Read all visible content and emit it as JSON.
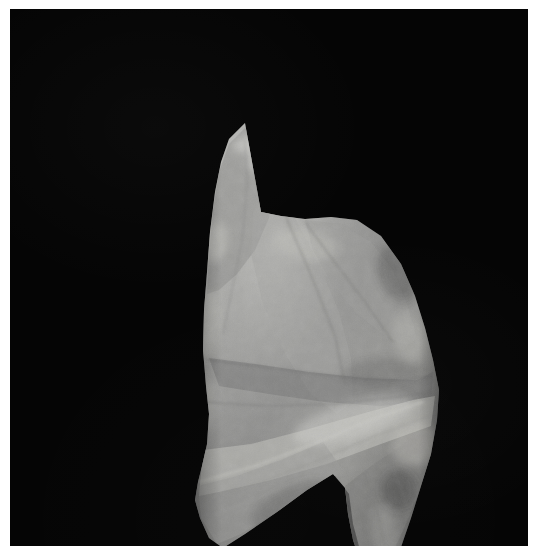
{
  "image": {
    "subject": "lithic-artifact",
    "caption": "",
    "background_color": "#050505",
    "page_color": "#ffffff",
    "field": {
      "left": 10,
      "top": 9,
      "width": 518,
      "height": 537
    }
  },
  "artifact": {
    "name": "stone-tool-flake",
    "description": "",
    "stone_color_light": "#b9b9b7",
    "stone_color_mid": "#8d8d8c",
    "stone_color_dark": "#5c5c5c",
    "stone_color_shadow": "#3a3a3a",
    "highlight_color": "#d6d6d2",
    "outline": "M 60,9 L 44,25 L 36,48 L 30,78 L 25,118 L 22,158 L 19,196 L 18,236 L 21,272 L 24,300 L 22,330 L 17,352 L 13,368 L 10,386 L 15,404 L 24,424 L 38,434 L 60,420 L 92,398 L 122,376 L 148,360 L 160,374 L 163,400 L 168,426 L 176,450 L 188,462 L 202,458 L 215,436 L 226,404 L 236,372 L 246,340 L 252,306 L 254,276 L 248,246 L 240,214 L 230,182 L 216,150 L 196,122 L 172,106 L 146,103 L 120,105 L 96,102 L 76,98 Z",
    "facets": [
      {
        "name": "upper-left-panel",
        "path": "M 60,14 L 44,30 L 34,58 L 28,96 L 24,140 L 22,180 L 34,176 L 52,160 L 70,136 L 84,104 L 88,68 L 80,36 Z",
        "fill": "#8f8f8e",
        "opacity": 0.55
      },
      {
        "name": "upper-right-panel",
        "path": "M 120,106 L 156,110 L 186,128 L 208,156 L 222,190 L 232,224 L 222,232 L 200,222 L 172,200 L 146,168 L 128,136 Z",
        "fill": "#9b9b99",
        "opacity": 0.5
      },
      {
        "name": "central-ridge",
        "path": "M 88,70 L 110,104 L 134,150 L 154,198 L 166,244 L 168,288 L 152,300 L 126,280 L 100,240 L 78,190 L 66,140 L 68,98 Z",
        "fill": "#a3a3a1",
        "opacity": 0.45
      },
      {
        "name": "mid-horizontal-band",
        "path": "M 24,244 L 70,250 L 124,258 L 180,264 L 232,266 L 248,258 L 246,286 L 196,292 L 140,288 L 84,280 L 34,272 Z",
        "fill": "#747473",
        "opacity": 0.5
      },
      {
        "name": "lower-bright-band",
        "path": "M 18,336 L 66,330 L 120,316 L 176,300 L 228,286 L 250,282 L 246,312 L 196,330 L 142,350 L 86,366 L 34,378 L 14,382 Z",
        "fill": "#c2c2be",
        "opacity": 0.55
      },
      {
        "name": "lower-left-taper",
        "path": "M 13,372 L 52,362 L 96,346 L 138,328 L 158,356 L 130,376 L 92,398 L 56,420 L 32,430 L 16,404 Z",
        "fill": "#9a9a98",
        "opacity": 0.5
      },
      {
        "name": "right-tang",
        "path": "M 160,372 L 186,352 L 216,332 L 240,316 L 246,342 L 234,378 L 220,412 L 206,442 L 192,458 L 178,446 L 168,416 L 162,392 Z",
        "fill": "#7b7b7a",
        "opacity": 0.55
      },
      {
        "name": "notch-shadow",
        "path": "M 150,362 L 164,380 L 168,410 L 176,440 L 166,434 L 152,402 L 146,378 Z",
        "fill": "#2e2e2e",
        "opacity": 0.6
      }
    ],
    "highlights": [
      {
        "name": "tip-highlight",
        "cx": 86,
        "cy": 40,
        "rx": 26,
        "ry": 16,
        "rot": -28,
        "fill": "#e2e2dd",
        "opacity": 0.5
      },
      {
        "name": "tip-scar-highlight",
        "cx": 62,
        "cy": 30,
        "rx": 14,
        "ry": 8,
        "rot": -18,
        "fill": "#f0f0ea",
        "opacity": 0.45
      },
      {
        "name": "left-shoulder-highlight",
        "cx": 30,
        "cy": 128,
        "rx": 13,
        "ry": 20,
        "rot": 12,
        "fill": "#d2d2cd",
        "opacity": 0.4
      },
      {
        "name": "left-edge-highlight",
        "cx": 23,
        "cy": 210,
        "rx": 10,
        "ry": 34,
        "rot": 6,
        "fill": "#cfcfc9",
        "opacity": 0.42
      },
      {
        "name": "left-edge-highlight-2",
        "cx": 22,
        "cy": 290,
        "rx": 9,
        "ry": 26,
        "rot": 4,
        "fill": "#c8c8c2",
        "opacity": 0.38
      },
      {
        "name": "mid-scar-highlight",
        "cx": 120,
        "cy": 130,
        "rx": 34,
        "ry": 16,
        "rot": 10,
        "fill": "#c9c9c4",
        "opacity": 0.34
      },
      {
        "name": "right-shoulder-highlight",
        "cx": 224,
        "cy": 224,
        "rx": 16,
        "ry": 26,
        "rot": -16,
        "fill": "#bdbdb8",
        "opacity": 0.36
      },
      {
        "name": "diagonal-band-highlight",
        "cx": 168,
        "cy": 306,
        "rx": 62,
        "ry": 18,
        "rot": -16,
        "fill": "#dadad4",
        "opacity": 0.42
      },
      {
        "name": "lower-right-highlight",
        "cx": 230,
        "cy": 330,
        "rx": 24,
        "ry": 22,
        "rot": -20,
        "fill": "#cccbc6",
        "opacity": 0.38
      },
      {
        "name": "tang-highlight",
        "cx": 200,
        "cy": 420,
        "rx": 13,
        "ry": 30,
        "rot": -8,
        "fill": "#a8a8a4",
        "opacity": 0.4
      }
    ],
    "shadows": [
      {
        "name": "right-upper-shadow",
        "cx": 212,
        "cy": 160,
        "rx": 18,
        "ry": 30,
        "rot": -22,
        "fill": "#3f3f3f",
        "opacity": 0.38
      },
      {
        "name": "right-notch-shadow",
        "cx": 210,
        "cy": 100,
        "rx": 10,
        "ry": 14,
        "rot": 0,
        "fill": "#262626",
        "opacity": 0.5
      },
      {
        "name": "lower-center-shadow",
        "cx": 110,
        "cy": 392,
        "rx": 46,
        "ry": 20,
        "rot": -22,
        "fill": "#4a4a4a",
        "opacity": 0.34
      },
      {
        "name": "tang-inner-shadow",
        "cx": 214,
        "cy": 376,
        "rx": 18,
        "ry": 20,
        "rot": -10,
        "fill": "#3a3a3a",
        "opacity": 0.4
      },
      {
        "name": "mid-right-shadow",
        "cx": 196,
        "cy": 258,
        "rx": 40,
        "ry": 14,
        "rot": -4,
        "fill": "#555555",
        "opacity": 0.3
      }
    ],
    "flake_lines": [
      {
        "name": "ridge-line-1",
        "d": "M 84,56 L 104,110 L 128,166 L 150,222 L 160,270",
        "stroke": "#6f6f6e",
        "width": 1.6,
        "opacity": 0.5
      },
      {
        "name": "ridge-line-2",
        "d": "M 60,26 L 62,70 L 58,120 L 48,172 L 38,220",
        "stroke": "#757574",
        "width": 1.3,
        "opacity": 0.42
      },
      {
        "name": "arris-line-1",
        "d": "M 120,108 L 148,146 L 180,188 L 208,228",
        "stroke": "#6a6a69",
        "width": 1.4,
        "opacity": 0.45
      },
      {
        "name": "band-line-top",
        "d": "M 23,246 L 86,254 L 150,262 L 210,266 L 248,262",
        "stroke": "#636363",
        "width": 1.5,
        "opacity": 0.5
      },
      {
        "name": "band-line-bottom",
        "d": "M 19,288 L 84,292 L 148,290 L 206,284 L 247,278",
        "stroke": "#6d6d6c",
        "width": 1.4,
        "opacity": 0.45
      },
      {
        "name": "diagonal-cleave",
        "d": "M 14,368 L 70,352 L 128,330 L 186,306 L 238,288",
        "stroke": "#cfcfca",
        "width": 2.0,
        "opacity": 0.5
      },
      {
        "name": "diagonal-cleave-2",
        "d": "M 18,384 L 76,368 L 134,346 L 190,322 L 244,302",
        "stroke": "#8f8f8d",
        "width": 1.4,
        "opacity": 0.4
      },
      {
        "name": "lower-scar-1",
        "d": "M 30,400 L 78,382 L 124,362 L 156,360",
        "stroke": "#a6a6a2",
        "width": 1.2,
        "opacity": 0.4
      },
      {
        "name": "tang-line-1",
        "d": "M 180,360 L 192,396 L 200,432 L 202,452",
        "stroke": "#6e6e6c",
        "width": 1.3,
        "opacity": 0.45
      },
      {
        "name": "tang-line-2",
        "d": "M 206,350 L 218,380 L 226,410 L 228,432",
        "stroke": "#757573",
        "width": 1.1,
        "opacity": 0.4
      },
      {
        "name": "tip-scar-line",
        "d": "M 46,32 L 72,26 L 96,38 L 112,60",
        "stroke": "#c0c0ba",
        "width": 1.2,
        "opacity": 0.45
      }
    ]
  }
}
